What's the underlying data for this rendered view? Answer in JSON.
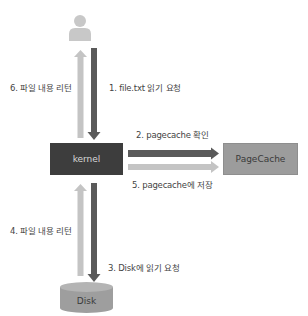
{
  "diagram": {
    "nodes": {
      "user": {
        "icon": "user-icon"
      },
      "kernel": {
        "label": "kernel"
      },
      "pagecache": {
        "label": "PageCache"
      },
      "disk": {
        "label": "Disk"
      }
    },
    "edges": [
      {
        "id": 1,
        "label": "1. file.txt 읽기 요청",
        "from": "user",
        "to": "kernel"
      },
      {
        "id": 2,
        "label": "2. pagecache 확인",
        "from": "kernel",
        "to": "pagecache"
      },
      {
        "id": 3,
        "label": "3. Disk에 읽기 요청",
        "from": "kernel",
        "to": "disk"
      },
      {
        "id": 4,
        "label": "4. 파일 내용 리턴",
        "from": "disk",
        "to": "kernel"
      },
      {
        "id": 5,
        "label": "5. pagecache에 저장",
        "from": "kernel",
        "to": "pagecache"
      },
      {
        "id": 6,
        "label": "6. 파일 내용 리턴",
        "from": "kernel",
        "to": "user"
      }
    ],
    "colors": {
      "dark_arrow": "#5a5a5a",
      "light_arrow": "#c4c4c4",
      "kernel_fill": "#3d3d3d",
      "pagecache_fill": "#9c9c9c",
      "disk_fill": "#9e9e9e",
      "user_icon": "#c8c8c8"
    }
  }
}
